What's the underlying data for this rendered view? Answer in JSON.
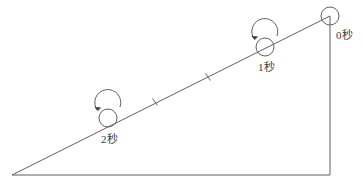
{
  "figure": {
    "type": "physics-diagram",
    "background_color": "#ffffff",
    "line_color": "#5f5f5f",
    "text_color": "#3a3a3a"
  },
  "incline": {
    "apex_label": "bottom-left-apex",
    "hypotenuse": {
      "x1": 12,
      "y1": 175,
      "x2": 330,
      "y2": 16
    },
    "base": {
      "x1": 12,
      "y1": 175,
      "x2": 330,
      "y2": 175
    },
    "vertical": {
      "x1": 330,
      "y1": 16,
      "x2": 330,
      "y2": 175
    }
  },
  "ticks": [
    {
      "name": "tick-mark-upper",
      "x": 208,
      "y": 77
    },
    {
      "name": "tick-mark-lower",
      "x": 155,
      "y": 102
    }
  ],
  "balls": [
    {
      "id": "ball-0",
      "label": "0秒",
      "seconds": 0,
      "cx": 330,
      "cy": 16,
      "r": 9,
      "has_rotation_arrow": false
    },
    {
      "id": "ball-1",
      "label": "1秒",
      "seconds": 1,
      "cx": 265,
      "cy": 47,
      "r": 9,
      "has_rotation_arrow": true,
      "arrow_direction": "counterclockwise"
    },
    {
      "id": "ball-2",
      "label": "2秒",
      "seconds": 2,
      "cx": 108,
      "cy": 118,
      "r": 9,
      "has_rotation_arrow": true,
      "arrow_direction": "counterclockwise"
    }
  ]
}
